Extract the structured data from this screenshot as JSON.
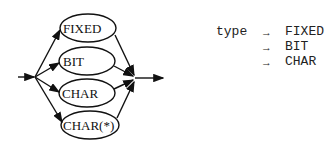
{
  "diagram": {
    "type": "syntax-diagram",
    "alternatives": [
      "FIXED",
      "BIT",
      "CHAR",
      "CHAR(*)"
    ]
  },
  "grammar": {
    "lhs": "type",
    "arrow": "→",
    "productions": [
      "FIXED",
      "BIT",
      "CHAR"
    ]
  }
}
